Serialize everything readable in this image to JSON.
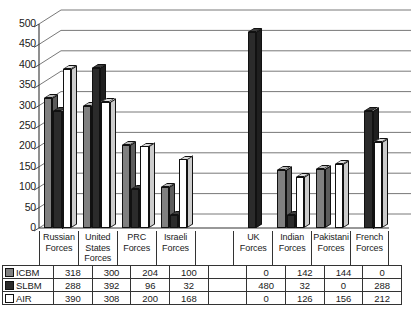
{
  "chart_data": {
    "type": "bar",
    "title": "",
    "xlabel": "",
    "ylabel": "",
    "ylim": [
      0,
      500
    ],
    "ytick_step": 50,
    "yticks": [
      0,
      50,
      100,
      150,
      200,
      250,
      300,
      350,
      400,
      450,
      500
    ],
    "grid": true,
    "legend_position": "table-row-headers",
    "style": "3d-grouped-column",
    "categories": [
      "Russian Forces",
      "United States Forces",
      "PRC Forces",
      "Israeli Forces",
      "",
      "UK Forces",
      "Indian Forces",
      "Pakistani Forces",
      "French Forces"
    ],
    "category_lines": [
      [
        "Russian",
        "Forces"
      ],
      [
        "United",
        "States",
        "Forces"
      ],
      [
        "PRC",
        "Forces"
      ],
      [
        "Israeli",
        "Forces"
      ],
      [
        ""
      ],
      [
        "UK",
        "Forces"
      ],
      [
        "Indian",
        "Forces"
      ],
      [
        "Pakistani",
        "Forces"
      ],
      [
        "French",
        "Forces"
      ]
    ],
    "series": [
      {
        "name": "ICBM",
        "color": "#808080",
        "values": [
          318,
          300,
          204,
          100,
          null,
          0,
          142,
          144,
          0
        ]
      },
      {
        "name": "SLBM",
        "color": "#2b2b2b",
        "values": [
          288,
          392,
          96,
          32,
          null,
          480,
          32,
          0,
          288
        ]
      },
      {
        "name": "AIR",
        "color": "#ffffff",
        "values": [
          390,
          308,
          200,
          168,
          null,
          0,
          126,
          156,
          212
        ]
      }
    ]
  },
  "table": {
    "rows": [
      {
        "label": "ICBM",
        "swatch": "#808080",
        "values": [
          "318",
          "300",
          "204",
          "100",
          "",
          "0",
          "142",
          "144",
          "0"
        ]
      },
      {
        "label": "SLBM",
        "swatch": "#2b2b2b",
        "values": [
          "288",
          "392",
          "96",
          "32",
          "",
          "480",
          "32",
          "0",
          "288"
        ]
      },
      {
        "label": "AIR",
        "swatch": "#ffffff",
        "values": [
          "390",
          "308",
          "200",
          "168",
          "",
          "0",
          "126",
          "156",
          "212"
        ]
      }
    ]
  },
  "axis": {
    "tick_labels": [
      "500",
      "450",
      "400",
      "350",
      "300",
      "250",
      "200",
      "150",
      "100",
      "50",
      "0"
    ]
  },
  "colors": {
    "icbm": "#808080",
    "slbm": "#2b2b2b",
    "air": "#ffffff",
    "gridline": "#555555",
    "border": "#333333"
  }
}
